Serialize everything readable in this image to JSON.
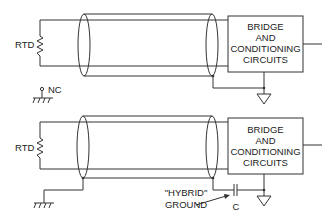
{
  "diagram": {
    "top_circuit": {
      "sensor_label": "RTD",
      "box_lines": [
        "BRIDGE",
        "AND",
        "CONDITIONING",
        "CIRCUITS"
      ],
      "sensor_ground_label": "NC"
    },
    "bottom_circuit": {
      "sensor_label": "RTD",
      "box_lines": [
        "BRIDGE",
        "AND",
        "CONDITIONING",
        "CIRCUITS"
      ],
      "annotation_lines": [
        "\"HYBRID\"",
        "GROUND"
      ],
      "capacitor_label": "C"
    },
    "colors": {
      "line": "#333333",
      "text": "#222222",
      "background": "#ffffff"
    }
  }
}
